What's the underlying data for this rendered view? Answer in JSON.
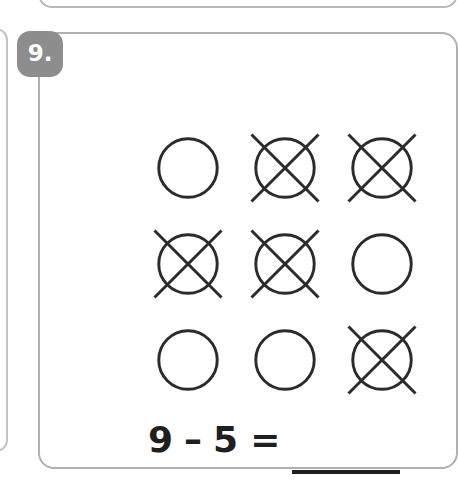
{
  "worksheet": {
    "question_number": "9.",
    "badge_color": "#8d8d8d",
    "badge_text_color": "#ffffff",
    "card_border_color": "#b0b0b0",
    "ink_color": "#2b2b2b"
  },
  "counters": {
    "total": 9,
    "crossed_out": 5,
    "remaining": 4,
    "shape": "circle",
    "cross_mark": "x-slash",
    "rows": 3,
    "columns": 3,
    "cells": [
      {
        "index": 1,
        "row": 1,
        "col": 1,
        "crossed": false,
        "label": "circle"
      },
      {
        "index": 2,
        "row": 1,
        "col": 2,
        "crossed": true,
        "label": "circle-crossed-out"
      },
      {
        "index": 3,
        "row": 1,
        "col": 3,
        "crossed": true,
        "label": "circle-crossed-out"
      },
      {
        "index": 4,
        "row": 2,
        "col": 1,
        "crossed": true,
        "label": "circle-crossed-out"
      },
      {
        "index": 5,
        "row": 2,
        "col": 2,
        "crossed": true,
        "label": "circle-crossed-out"
      },
      {
        "index": 6,
        "row": 2,
        "col": 3,
        "crossed": false,
        "label": "circle"
      },
      {
        "index": 7,
        "row": 3,
        "col": 1,
        "crossed": false,
        "label": "circle"
      },
      {
        "index": 8,
        "row": 3,
        "col": 2,
        "crossed": false,
        "label": "circle"
      },
      {
        "index": 9,
        "row": 3,
        "col": 3,
        "crossed": true,
        "label": "circle-crossed-out"
      }
    ]
  },
  "equation": {
    "minuend": "9",
    "operator": "–",
    "subtrahend": "5",
    "equals": "=",
    "answer": "",
    "answer_placeholder": "",
    "full_text": "9 – 5 = ____"
  }
}
